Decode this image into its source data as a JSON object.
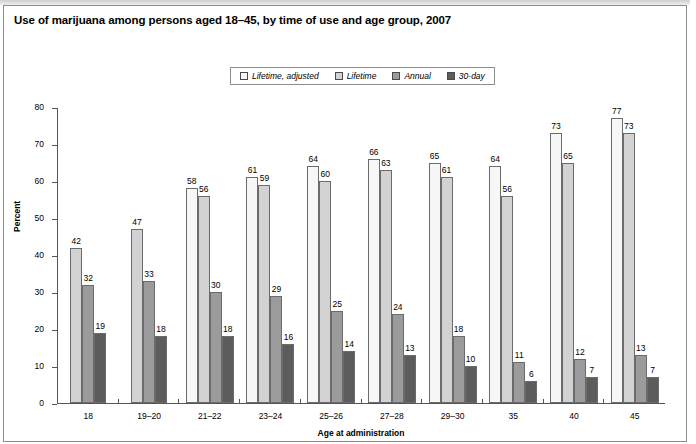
{
  "figure": {
    "title": "Use of marijuana among persons aged 18–45, by time of use and age group, 2007"
  },
  "legend": {
    "items": [
      {
        "label": "Lifetime, adjusted",
        "color": "#f7f7f7"
      },
      {
        "label": "Lifetime",
        "color": "#d2d2d2"
      },
      {
        "label": "Annual",
        "color": "#9b9b9b"
      },
      {
        "label": "30-day",
        "color": "#5c5c5c"
      }
    ]
  },
  "chart_data": {
    "type": "bar",
    "title": "Use of marijuana among persons aged 18–45, by time of use and age group, 2007",
    "xlabel": "Age at administration",
    "ylabel": "Percent",
    "ylim": [
      0,
      80
    ],
    "yticks": [
      0,
      10,
      20,
      30,
      40,
      50,
      60,
      70,
      80
    ],
    "grid": false,
    "legend_position": "top-center",
    "categories": [
      "18",
      "19–20",
      "21–22",
      "23–24",
      "25–26",
      "27–28",
      "29–30",
      "35",
      "40",
      "45"
    ],
    "series": [
      {
        "name": "Lifetime, adjusted",
        "color": "#f7f7f7",
        "values": [
          null,
          null,
          58,
          61,
          64,
          66,
          65,
          64,
          73,
          77
        ]
      },
      {
        "name": "Lifetime",
        "color": "#d2d2d2",
        "values": [
          42,
          47,
          56,
          59,
          60,
          63,
          61,
          56,
          65,
          73
        ]
      },
      {
        "name": "Annual",
        "color": "#9b9b9b",
        "values": [
          32,
          33,
          30,
          29,
          25,
          24,
          18,
          11,
          12,
          13
        ]
      },
      {
        "name": "30-day",
        "color": "#5c5c5c",
        "values": [
          19,
          18,
          18,
          16,
          14,
          13,
          10,
          6,
          7,
          7
        ]
      }
    ]
  }
}
